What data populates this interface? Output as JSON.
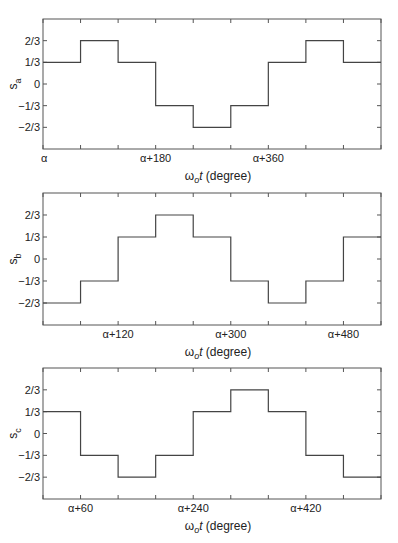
{
  "figure": {
    "width": 398,
    "height": 543,
    "colors": {
      "line": "#444444",
      "axis": "#555555",
      "text": "#222222",
      "background": "#ffffff"
    }
  },
  "chart_data": [
    {
      "type": "line",
      "step": true,
      "title": "",
      "ylabel": "s",
      "ylabel_subscript": "a",
      "xlabel": "ωot (degree)",
      "xlabel_parts": {
        "omega": "ω",
        "sub": "o",
        "t": "t",
        "unit": " (degree)"
      },
      "xlim": [
        0,
        540
      ],
      "ylim": [
        -1,
        1
      ],
      "x_ticks": [
        0,
        60,
        120,
        180,
        240,
        300,
        360,
        420,
        480,
        540
      ],
      "x_tick_labels": [
        {
          "x": 0,
          "label": "α"
        },
        {
          "x": 180,
          "label": "α+180"
        },
        {
          "x": 360,
          "label": "α+360"
        }
      ],
      "y_ticks": [
        {
          "y": 0.6667,
          "label": "2/3"
        },
        {
          "y": 0.3333,
          "label": "1/3"
        },
        {
          "y": 0,
          "label": "0"
        },
        {
          "y": -0.3333,
          "label": "-1/3"
        },
        {
          "y": -0.6667,
          "label": "-2/3"
        }
      ],
      "segment_width": 60,
      "values": [
        0.3333,
        0.6667,
        0.3333,
        -0.3333,
        -0.6667,
        -0.3333,
        0.3333,
        0.6667,
        0.3333
      ],
      "values_text": [
        "1/3",
        "2/3",
        "1/3",
        "-1/3",
        "-2/3",
        "-1/3",
        "1/3",
        "2/3",
        "1/3"
      ],
      "grid": false,
      "layout": {
        "left": 43,
        "right": 381,
        "top": 19,
        "bottom": 149
      }
    },
    {
      "type": "line",
      "step": true,
      "title": "",
      "ylabel": "s",
      "ylabel_subscript": "b",
      "xlabel": "ωot (degree)",
      "xlabel_parts": {
        "omega": "ω",
        "sub": "o",
        "t": "t",
        "unit": " (degree)"
      },
      "xlim": [
        0,
        540
      ],
      "ylim": [
        -1,
        1
      ],
      "x_ticks": [
        0,
        60,
        120,
        180,
        240,
        300,
        360,
        420,
        480,
        540
      ],
      "x_tick_labels": [
        {
          "x": 120,
          "label": "α+120"
        },
        {
          "x": 300,
          "label": "α+300"
        },
        {
          "x": 480,
          "label": "α+480"
        }
      ],
      "y_ticks": [
        {
          "y": 0.6667,
          "label": "2/3"
        },
        {
          "y": 0.3333,
          "label": "1/3"
        },
        {
          "y": 0,
          "label": "0"
        },
        {
          "y": -0.3333,
          "label": "-1/3"
        },
        {
          "y": -0.6667,
          "label": "-2/3"
        }
      ],
      "segment_width": 60,
      "values": [
        -0.6667,
        -0.3333,
        0.3333,
        0.6667,
        0.3333,
        -0.3333,
        -0.6667,
        -0.3333,
        0.3333
      ],
      "values_text": [
        "-2/3",
        "-1/3",
        "1/3",
        "2/3",
        "1/3",
        "-1/3",
        "-2/3",
        "-1/3",
        "1/3"
      ],
      "grid": false,
      "layout": {
        "left": 43,
        "right": 381,
        "top": 193,
        "bottom": 325
      }
    },
    {
      "type": "line",
      "step": true,
      "title": "",
      "ylabel": "s",
      "ylabel_subscript": "c",
      "xlabel": "ωot (degree)",
      "xlabel_parts": {
        "omega": "ω",
        "sub": "o",
        "t": "t",
        "unit": " (degree)"
      },
      "xlim": [
        0,
        540
      ],
      "ylim": [
        -1,
        1
      ],
      "x_ticks": [
        0,
        60,
        120,
        180,
        240,
        300,
        360,
        420,
        480,
        540
      ],
      "x_tick_labels": [
        {
          "x": 60,
          "label": "α+60"
        },
        {
          "x": 240,
          "label": "α+240"
        },
        {
          "x": 420,
          "label": "α+420"
        }
      ],
      "y_ticks": [
        {
          "y": 0.6667,
          "label": "2/3"
        },
        {
          "y": 0.3333,
          "label": "1/3"
        },
        {
          "y": 0,
          "label": "0"
        },
        {
          "y": -0.3333,
          "label": "-1/3"
        },
        {
          "y": -0.6667,
          "label": "-2/3"
        }
      ],
      "segment_width": 60,
      "values": [
        0.3333,
        -0.3333,
        -0.6667,
        -0.3333,
        0.3333,
        0.6667,
        0.3333,
        -0.3333,
        -0.6667
      ],
      "values_text": [
        "1/3",
        "-1/3",
        "-2/3",
        "-1/3",
        "1/3",
        "2/3",
        "1/3",
        "-1/3",
        "-2/3"
      ],
      "grid": false,
      "layout": {
        "left": 43,
        "right": 381,
        "top": 368,
        "bottom": 499
      }
    }
  ]
}
